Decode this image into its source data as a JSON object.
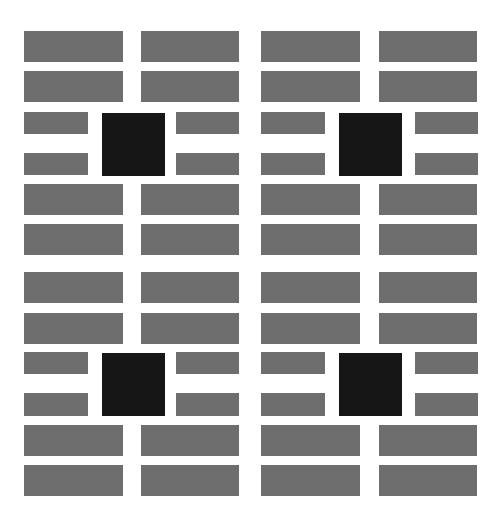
{
  "colors": {
    "background": "#ffffff",
    "bar": "#6e6e6e",
    "square": "#161616"
  },
  "panels": [
    {
      "name": "left-panel",
      "x": 24,
      "long_w": 99,
      "gap_x": 141,
      "short_w": 64,
      "short2_x": 176,
      "square_x": 102
    },
    {
      "name": "right-panel",
      "x": 261,
      "long_w": 99,
      "gap_x": 379,
      "short_w": 64,
      "short2_x": 415,
      "square_x": 339
    }
  ],
  "long_rows": [
    {
      "y": 31,
      "h": 31
    },
    {
      "y": 71,
      "h": 31
    },
    {
      "y": 184,
      "h": 31
    },
    {
      "y": 224,
      "h": 31
    },
    {
      "y": 272,
      "h": 31
    },
    {
      "y": 313,
      "h": 31
    },
    {
      "y": 425,
      "h": 31
    },
    {
      "y": 465,
      "h": 31
    }
  ],
  "short_rows": [
    {
      "y": 112,
      "h": 22
    },
    {
      "y": 153,
      "h": 22
    },
    {
      "y": 352,
      "h": 22
    },
    {
      "y": 393,
      "h": 23
    }
  ],
  "squares": [
    {
      "y": 113,
      "size": 63
    },
    {
      "y": 353,
      "size": 63
    }
  ]
}
